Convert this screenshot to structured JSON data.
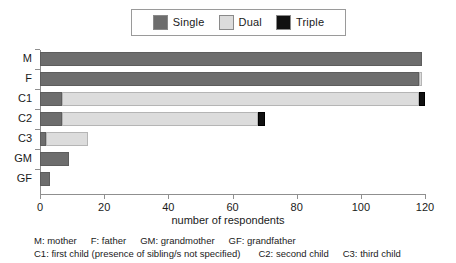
{
  "legend": {
    "entries": [
      {
        "label": "Single",
        "color": "#6d6d6d",
        "key": "single"
      },
      {
        "label": "Dual",
        "color": "#dcdcdc",
        "key": "dual"
      },
      {
        "label": "Triple",
        "color": "#111111",
        "key": "triple"
      }
    ]
  },
  "axis": {
    "x_title": "number of respondents",
    "x_ticks": [
      "0",
      "20",
      "40",
      "60",
      "80",
      "100",
      "120"
    ],
    "y_labels": [
      "M",
      "F",
      "C1",
      "C2",
      "C3",
      "GM",
      "GF"
    ]
  },
  "caption": {
    "line1": [
      "M: mother",
      "F: father",
      "GM: grandmother",
      "GF: grandfather"
    ],
    "line2": [
      "C1: first child (presence of sibling/s not specified)",
      "C2: second child",
      "C3: third child"
    ]
  },
  "chart_data": {
    "type": "bar",
    "orientation": "horizontal",
    "stacked": true,
    "title": "",
    "xlabel": "number of respondents",
    "ylabel": "",
    "xlim": [
      0,
      120
    ],
    "grid": false,
    "legend_position": "top",
    "categories": [
      "M",
      "F",
      "C1",
      "C2",
      "C3",
      "GM",
      "GF"
    ],
    "series": [
      {
        "name": "Single",
        "color": "#6d6d6d",
        "values": [
          119,
          118,
          7,
          7,
          2,
          9,
          3
        ]
      },
      {
        "name": "Dual",
        "color": "#dcdcdc",
        "values": [
          0,
          1,
          111,
          61,
          13,
          0,
          0
        ]
      },
      {
        "name": "Triple",
        "color": "#111111",
        "values": [
          0,
          0,
          2,
          2,
          0,
          0,
          0
        ]
      }
    ],
    "totals": [
      119,
      119,
      120,
      70,
      15,
      9,
      3
    ]
  }
}
